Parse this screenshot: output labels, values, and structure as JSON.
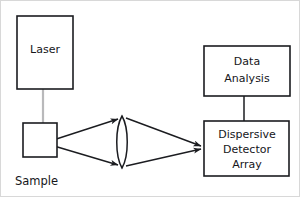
{
  "diagram": {
    "background_color": "#ffffff",
    "line_color": "#1b1c20",
    "beam_color": "#b9b9bb",
    "border_color": "#d8d8d8",
    "boxes": [
      {
        "id": "laser",
        "label": "Laser",
        "lines": [
          "Laser"
        ],
        "x": 16,
        "y": 15,
        "w": 56,
        "h": 73
      },
      {
        "id": "sample",
        "label": "Sample",
        "lines": [],
        "x": 22,
        "y": 122,
        "w": 34,
        "h": 34
      },
      {
        "id": "data-analysis",
        "label": "Data Analysis",
        "lines": [
          "Data",
          "Analysis"
        ],
        "x": 203,
        "y": 45,
        "w": 86,
        "h": 50
      },
      {
        "id": "dispersive-detector-array",
        "label": "Dispersive Detector Array",
        "lines": [
          "Dispersive",
          "Detector",
          "Array"
        ],
        "x": 203,
        "y": 120,
        "w": 85,
        "h": 55
      }
    ],
    "free_labels": [
      {
        "id": "sample-caption",
        "text": "Sample",
        "x": 14,
        "y": 180
      }
    ],
    "optics": [
      {
        "id": "collecting-lens",
        "type": "biconvex-lens",
        "cx": 121,
        "cy": 141,
        "half_height": 26,
        "half_width": 6
      }
    ],
    "beams": [
      {
        "id": "excitation-beam",
        "from": "laser",
        "to": "sample",
        "color": "#b9b9bb",
        "arrow": true
      }
    ],
    "rays": [
      {
        "id": "scatter-ray-upper",
        "from": "sample",
        "to": "collecting-lens",
        "arrow": true
      },
      {
        "id": "scatter-ray-lower",
        "from": "sample",
        "to": "collecting-lens",
        "arrow": true
      },
      {
        "id": "focus-ray-upper",
        "from": "collecting-lens",
        "to": "dispersive-detector-array",
        "arrow": true
      },
      {
        "id": "focus-ray-lower",
        "from": "collecting-lens",
        "to": "dispersive-detector-array",
        "arrow": true
      }
    ],
    "connectors": [
      {
        "id": "detector-to-analysis",
        "from": "dispersive-detector-array",
        "to": "data-analysis",
        "arrow": false
      }
    ]
  }
}
